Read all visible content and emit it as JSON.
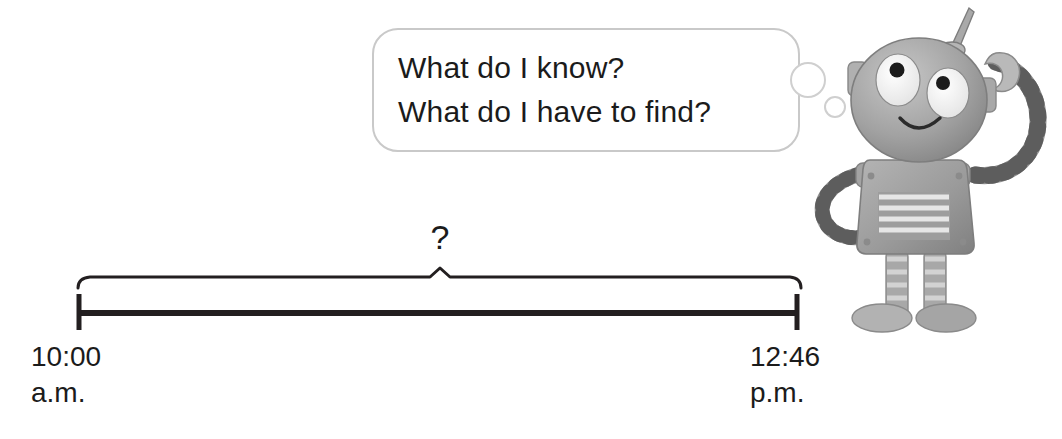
{
  "scene": {
    "title": "Elapsed time number line with thinking robot",
    "background_color": "#ffffff"
  },
  "thought_bubble": {
    "name": "thought-bubble",
    "line1": "What do I know?",
    "line2": "What do I have to find?",
    "text": "What do I know?\nWhat do I have to find?",
    "border_color": "#c9c9c9",
    "text_color": "#1b1b1b",
    "tail_dots": [
      "large-circle",
      "small-circle"
    ]
  },
  "timeline": {
    "name": "elapsed-time-number-line",
    "unknown_symbol": "?",
    "line_color": "#231f20",
    "start": {
      "time": "10:00",
      "meridiem": "a.m.",
      "label": "10:00\na.m."
    },
    "end": {
      "time": "12:46",
      "meridiem": "p.m.",
      "label": "12:46\np.m."
    },
    "brace": {
      "name": "elapsed-time-brace",
      "peak_symbol": "?"
    }
  },
  "robot": {
    "name": "robot-character",
    "body_color": "#9a9a9a",
    "highlight_color": "#c9c9c9",
    "outline_color": "#6e6e6e",
    "parts": [
      "antenna",
      "head",
      "left-eye",
      "right-eye",
      "smile",
      "left-ear-tab",
      "right-ear-tab",
      "torso",
      "vent-panel",
      "raised-arm",
      "hip-arm",
      "left-leg",
      "right-leg",
      "left-foot",
      "right-foot"
    ]
  }
}
